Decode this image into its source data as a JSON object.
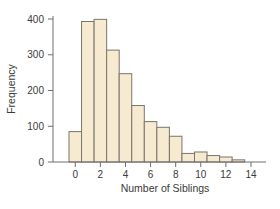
{
  "chart_data": {
    "type": "bar",
    "title": "",
    "xlabel": "Number of Siblings",
    "ylabel": "Frequency",
    "categories": [
      0,
      1,
      2,
      3,
      4,
      5,
      6,
      7,
      8,
      9,
      10,
      11,
      12,
      13
    ],
    "values": [
      85,
      393,
      399,
      313,
      247,
      158,
      113,
      97,
      72,
      24,
      28,
      18,
      14,
      6
    ],
    "ylim": [
      0,
      410
    ],
    "xlim": [
      -0.5,
      15
    ],
    "yticks": [
      0,
      100,
      200,
      300,
      400
    ],
    "xticks": [
      0,
      2,
      4,
      6,
      8,
      10,
      12,
      14
    ],
    "grid": false,
    "legend": null,
    "colors": {
      "fill": "#f6ead0",
      "stroke": "#7d746a",
      "axis": "#6e6e6e",
      "text": "#3a3a3a"
    }
  }
}
